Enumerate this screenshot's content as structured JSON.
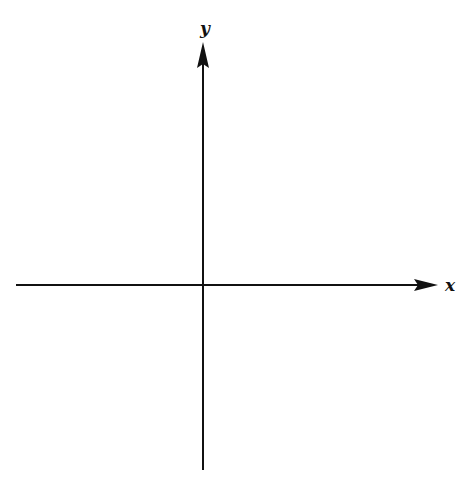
{
  "diagram": {
    "type": "cartesian-axes",
    "colors": {
      "axis": "#111111",
      "background": "#ffffff"
    },
    "x_axis": {
      "label": "x",
      "line": {
        "x1": 16,
        "y1": 285,
        "x2": 418,
        "y2": 285
      },
      "arrow": {
        "tip_x": 438,
        "y": 285,
        "base_x": 414,
        "half_width": 6
      },
      "label_pos": {
        "x": 450,
        "y": 291
      }
    },
    "y_axis": {
      "label": "y",
      "line": {
        "x1": 203,
        "y1": 470,
        "x2": 203,
        "y2": 64
      },
      "arrow": {
        "tip_y": 42,
        "x": 203,
        "base_y": 68,
        "half_width": 6
      },
      "label_pos": {
        "x": 205,
        "y": 34
      }
    },
    "origin": {
      "x": 203,
      "y": 285
    }
  }
}
